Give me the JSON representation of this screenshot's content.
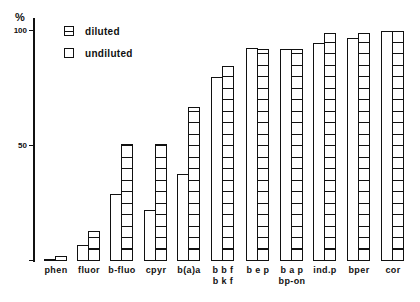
{
  "chart_data": {
    "type": "bar",
    "title": "",
    "xlabel": "",
    "ylabel": "%",
    "ylim": [
      0,
      100
    ],
    "yticks": [
      100,
      50
    ],
    "ytick_labels": [
      "100",
      "50"
    ],
    "grid": false,
    "legend_position": "top-left",
    "legend": [
      {
        "name": "diluted",
        "pattern": "hatched"
      },
      {
        "name": "undiluted",
        "pattern": "plain"
      }
    ],
    "categories": [
      "phen",
      "fluor",
      "b-fluo",
      "cpyr",
      "b(a)a",
      "bbf bkf",
      "bep",
      "bap bp-on",
      "ind.p",
      "bper",
      "cor"
    ],
    "category_labels": [
      [
        "phen"
      ],
      [
        "fluor"
      ],
      [
        "b-fluo"
      ],
      [
        "cpyr"
      ],
      [
        "b(a)a"
      ],
      [
        "b b f",
        "b k f"
      ],
      [
        "b e p"
      ],
      [
        "b a p",
        "bp-on"
      ],
      [
        "ind.p"
      ],
      [
        "bper"
      ],
      [
        "cor"
      ]
    ],
    "series": [
      {
        "name": "undiluted",
        "values": [
          1,
          7,
          29,
          22,
          38,
          80,
          92.5,
          92,
          95,
          97,
          100
        ]
      },
      {
        "name": "diluted",
        "values": [
          2,
          13,
          51,
          51,
          67,
          85,
          92,
          92,
          99,
          99,
          100
        ]
      }
    ]
  },
  "legend": {
    "diluted": "diluted",
    "undiluted": "undiluted"
  },
  "axis": {
    "ylabel": "%",
    "tick_100": "100",
    "tick_50": "50"
  },
  "colors": {
    "ink": "#111111",
    "background": "#ffffff"
  }
}
